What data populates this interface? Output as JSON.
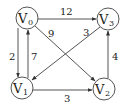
{
  "diagram": {
    "type": "directed-weighted-graph",
    "nodes": [
      {
        "id": "V0",
        "label": "V",
        "sub": "0",
        "x": 27,
        "y": 18
      },
      {
        "id": "V1",
        "label": "V",
        "sub": "1",
        "x": 22,
        "y": 88
      },
      {
        "id": "V2",
        "label": "V",
        "sub": "2",
        "x": 104,
        "y": 89
      },
      {
        "id": "V3",
        "label": "V",
        "sub": "3",
        "x": 108,
        "y": 19
      }
    ],
    "edges": [
      {
        "from": "V0",
        "to": "V3",
        "weight": "12"
      },
      {
        "from": "V0",
        "to": "V1",
        "weight": "2"
      },
      {
        "from": "V1",
        "to": "V0",
        "weight": "7"
      },
      {
        "from": "V0",
        "to": "V2",
        "weight": "9"
      },
      {
        "from": "V3",
        "to": "V1",
        "weight": "3"
      },
      {
        "from": "V2",
        "to": "V3",
        "weight": "4"
      },
      {
        "from": "V1",
        "to": "V2",
        "weight": "3"
      }
    ],
    "colors": {
      "stroke": "#555555",
      "text": "#222222",
      "background": "#ffffff"
    }
  }
}
